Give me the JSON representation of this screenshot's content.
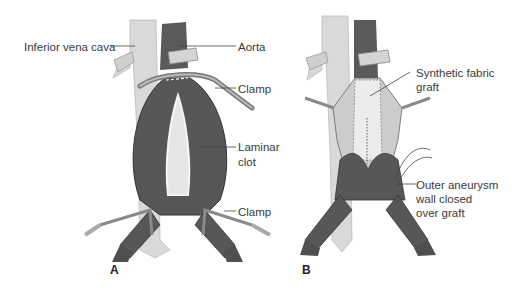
{
  "figure": {
    "panel_a": {
      "letter": "A",
      "labels": {
        "ivc": "Inferior vena cava",
        "aorta": "Aorta",
        "clamp_top": "Clamp",
        "laminar_line1": "Laminar",
        "laminar_line2": "clot",
        "clamp_bottom": "Clamp"
      }
    },
    "panel_b": {
      "letter": "B",
      "labels": {
        "graft_line1": "Synthetic fabric",
        "graft_line2": "graft",
        "wall_line1": "Outer aneurysm",
        "wall_line2": "wall closed",
        "wall_line3": "over graft"
      }
    },
    "colors": {
      "vessel_dark": "#5a5a5a",
      "vessel_light": "#d9d9d9",
      "clot": "#e6e6e6",
      "graft": "#ececec",
      "clamp": "#9a9a9a",
      "text": "#3a3a3a"
    }
  }
}
